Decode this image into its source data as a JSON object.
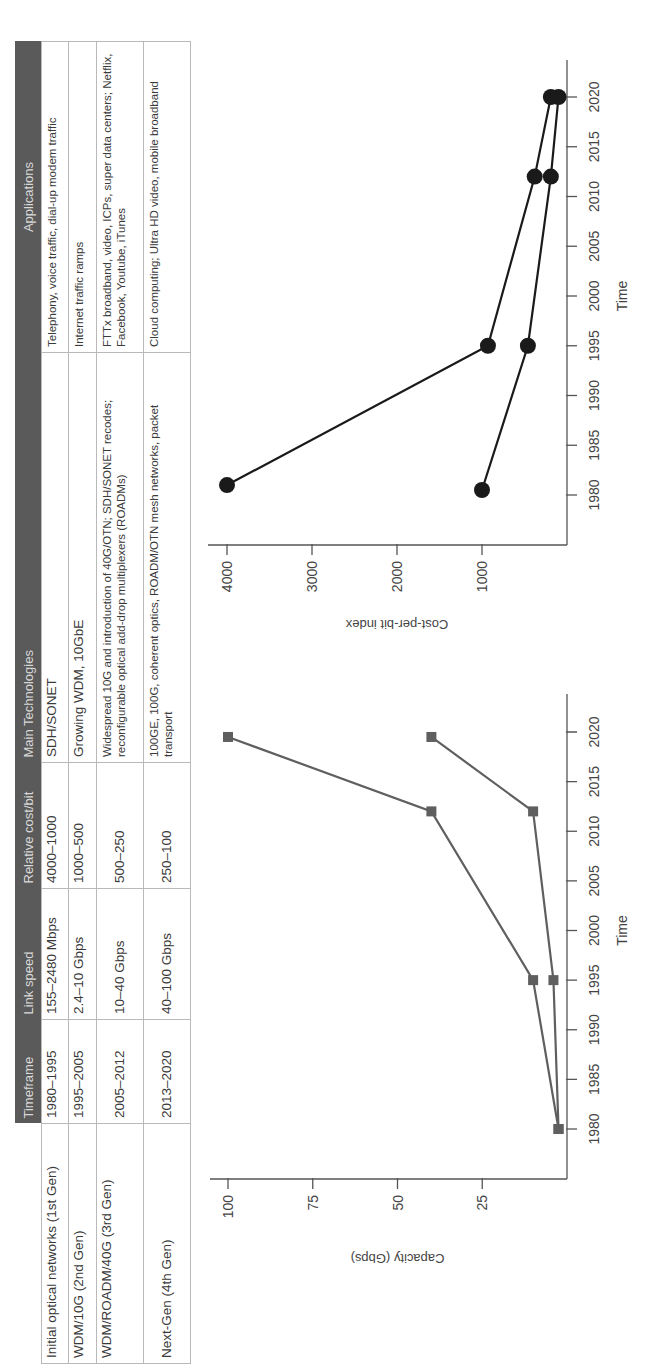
{
  "table": {
    "headers": [
      "",
      "Timeframe",
      "Link speed",
      "Relative cost/bit",
      "Main Technologies",
      "Applications"
    ],
    "rows": [
      {
        "generation": "Initial optical networks (1st Gen)",
        "timeframe": "1980–1995",
        "link_speed": "155–2480 Mbps",
        "relative_cost": "4000–1000",
        "technologies": "SDH/SONET",
        "applications": "Telephony, voice traffic, dial-up modem traffic"
      },
      {
        "generation": "WDM/10G (2nd Gen)",
        "timeframe": "1995–2005",
        "link_speed": "2.4–10 Gbps",
        "relative_cost": "1000–500",
        "technologies": "Growing WDM, 10GbE",
        "applications": "Internet traffic ramps"
      },
      {
        "generation": "WDM/ROADM/40G (3rd Gen)",
        "timeframe": "2005–2012",
        "link_speed": "10–40 Gbps",
        "relative_cost": "500–250",
        "technologies": "Widespread 10G and introduction of 40G/OTN; SDH/SONET recodes; reconfigurable optical add-drop multiplexers (ROADMs)",
        "applications": "FTTx broadband, video, ICPs, super data centers; Netflix, Facebook, Youtube, iTunes"
      },
      {
        "generation": "Next-Gen (4th Gen)",
        "timeframe": "2013–2020",
        "link_speed": "40–100 Gbps",
        "relative_cost": "250–100",
        "technologies": "100GE, 100G, coherent optics, ROADM/OTN mesh networks, packet transport",
        "applications": "Cloud computing; Ultra HD video, mobile broadband"
      }
    ]
  },
  "chart_data": [
    {
      "type": "line",
      "title": "",
      "xlabel": "Time",
      "ylabel": "Capacity (Gbps)",
      "xlim": [
        1977,
        2023
      ],
      "ylim": [
        0,
        100
      ],
      "xticks": [
        1980,
        1985,
        1990,
        1995,
        2000,
        2005,
        2010,
        2015,
        2020
      ],
      "yticks": [
        25,
        50,
        75,
        100
      ],
      "marker": "square",
      "color": "#5f5f5f",
      "grid": false,
      "series": [
        {
          "name": "Upper bound",
          "x": [
            1980,
            1995,
            2012,
            2019.5
          ],
          "y": [
            2.5,
            10,
            40,
            100
          ]
        },
        {
          "name": "Lower bound",
          "x": [
            1980,
            1995,
            2012,
            2019.5
          ],
          "y": [
            2.5,
            4,
            10,
            40
          ]
        }
      ]
    },
    {
      "type": "line",
      "title": "",
      "xlabel": "Time",
      "ylabel": "Cost-per-bit index",
      "xlim": [
        1977,
        2023
      ],
      "ylim": [
        0,
        4000
      ],
      "xticks": [
        1980,
        1985,
        1990,
        1995,
        2000,
        2005,
        2010,
        2015,
        2020
      ],
      "yticks": [
        1000,
        2000,
        3000,
        4000
      ],
      "marker": "circle",
      "color": "#1a1a1a",
      "grid": false,
      "series": [
        {
          "name": "Upper bound",
          "x": [
            1981,
            1995,
            2012,
            2020
          ],
          "y": [
            4000,
            930,
            380,
            190
          ]
        },
        {
          "name": "Lower bound",
          "x": [
            1980.5,
            1995,
            2012,
            2020
          ],
          "y": [
            1000,
            460,
            190,
            100
          ]
        }
      ]
    }
  ]
}
